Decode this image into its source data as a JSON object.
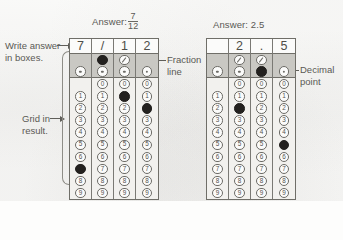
{
  "figure": {
    "background_color": "#fdfdfc",
    "ink_color": "#55544f",
    "fill_color": "#23211f",
    "shade_color": "#c9c8c3"
  },
  "labels": {
    "write_answer": "Write answer\nin boxes.",
    "write_answer_line1": "Write answer",
    "write_answer_line2": "in boxes.",
    "grid_in_result_line1": "Grid in",
    "grid_in_result_line2": "result.",
    "fraction_line_line1": "Fraction",
    "fraction_line_line2": "line",
    "decimal_point_line1": "Decimal",
    "decimal_point_line2": "point"
  },
  "grids": [
    {
      "id": "grid-fraction",
      "answer_label_prefix": "Answer:",
      "answer_type": "fraction",
      "answer_numerator": "7",
      "answer_denominator": "12",
      "answer_value": "7/12",
      "written_answer": [
        "7",
        "/",
        "1",
        "2"
      ],
      "digit_labels": [
        "0",
        "1",
        "2",
        "3",
        "4",
        "5",
        "6",
        "7",
        "8",
        "9"
      ],
      "columns": [
        {
          "index": 1,
          "written": "7",
          "has_fraction_bubble": false,
          "has_decimal_bubble": true,
          "fraction_filled": false,
          "decimal_filled": false,
          "has_zero_bubble": false,
          "filled_digit": "7"
        },
        {
          "index": 2,
          "written": "/",
          "has_fraction_bubble": true,
          "has_decimal_bubble": true,
          "fraction_filled": true,
          "decimal_filled": false,
          "has_zero_bubble": true,
          "filled_digit": null
        },
        {
          "index": 3,
          "written": "1",
          "has_fraction_bubble": true,
          "has_decimal_bubble": true,
          "fraction_filled": false,
          "decimal_filled": false,
          "has_zero_bubble": true,
          "filled_digit": "1"
        },
        {
          "index": 4,
          "written": "2",
          "has_fraction_bubble": false,
          "has_decimal_bubble": true,
          "fraction_filled": false,
          "decimal_filled": false,
          "has_zero_bubble": true,
          "filled_digit": "2"
        }
      ]
    },
    {
      "id": "grid-decimal",
      "answer_label_prefix": "Answer:",
      "answer_type": "decimal",
      "answer_value": "2.5",
      "written_answer": [
        "",
        "2",
        ".",
        "5"
      ],
      "digit_labels": [
        "0",
        "1",
        "2",
        "3",
        "4",
        "5",
        "6",
        "7",
        "8",
        "9"
      ],
      "columns": [
        {
          "index": 1,
          "written": "",
          "has_fraction_bubble": false,
          "has_decimal_bubble": true,
          "fraction_filled": false,
          "decimal_filled": false,
          "has_zero_bubble": false,
          "filled_digit": null
        },
        {
          "index": 2,
          "written": "2",
          "has_fraction_bubble": true,
          "has_decimal_bubble": true,
          "fraction_filled": false,
          "decimal_filled": false,
          "has_zero_bubble": true,
          "filled_digit": "2"
        },
        {
          "index": 3,
          "written": ".",
          "has_fraction_bubble": true,
          "has_decimal_bubble": true,
          "fraction_filled": false,
          "decimal_filled": true,
          "has_zero_bubble": true,
          "filled_digit": null
        },
        {
          "index": 4,
          "written": "5",
          "has_fraction_bubble": false,
          "has_decimal_bubble": true,
          "fraction_filled": false,
          "decimal_filled": false,
          "has_zero_bubble": true,
          "filled_digit": "5"
        }
      ]
    }
  ]
}
